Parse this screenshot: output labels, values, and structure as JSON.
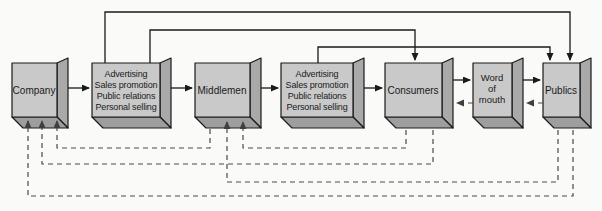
{
  "colors": {
    "background": "#fafaf8",
    "box_front": "#c9c9c9",
    "box_side": "#a9a9a9",
    "box_bottom": "#9e9e9e",
    "box_border": "#1a1a1a",
    "solid_line": "#1a1a1a",
    "dashed_line": "#4a4a4a"
  },
  "nodes": [
    {
      "id": "company",
      "label": "Company"
    },
    {
      "id": "promotion-mix-1",
      "lines": [
        "Advertising",
        "Sales promotion",
        "Public relations",
        "Personal selling"
      ]
    },
    {
      "id": "middlemen",
      "label": "Middlemen"
    },
    {
      "id": "promotion-mix-2",
      "lines": [
        "Advertising",
        "Sales promotion",
        "Public relations",
        "Personal selling"
      ]
    },
    {
      "id": "consumers",
      "label": "Consumers"
    },
    {
      "id": "word-of-mouth",
      "lines": [
        "Word",
        "of",
        "mouth"
      ]
    },
    {
      "id": "publics",
      "label": "Publics"
    }
  ],
  "edges": [
    {
      "from": "company",
      "to": "promotion-mix-1",
      "style": "solid",
      "route": "middle"
    },
    {
      "from": "promotion-mix-1",
      "to": "middlemen",
      "style": "solid",
      "route": "middle"
    },
    {
      "from": "middlemen",
      "to": "promotion-mix-2",
      "style": "solid",
      "route": "middle"
    },
    {
      "from": "promotion-mix-2",
      "to": "consumers",
      "style": "solid",
      "route": "middle"
    },
    {
      "from": "consumers",
      "to": "word-of-mouth",
      "style": "solid",
      "route": "middle"
    },
    {
      "from": "word-of-mouth",
      "to": "publics",
      "style": "solid",
      "route": "middle"
    },
    {
      "from": "promotion-mix-1",
      "to": "publics",
      "style": "solid",
      "route": "top"
    },
    {
      "from": "promotion-mix-1",
      "to": "consumers",
      "style": "solid",
      "route": "top"
    },
    {
      "from": "promotion-mix-2",
      "to": "publics",
      "style": "solid",
      "route": "top"
    },
    {
      "from": "word-of-mouth",
      "to": "consumers",
      "style": "dashed",
      "route": "middle"
    },
    {
      "from": "publics",
      "to": "word-of-mouth",
      "style": "dashed",
      "route": "middle"
    },
    {
      "from": "middlemen",
      "to": "company",
      "style": "dashed",
      "route": "bottom"
    },
    {
      "from": "consumers",
      "to": "middlemen",
      "style": "dashed",
      "route": "bottom"
    },
    {
      "from": "consumers",
      "to": "company",
      "style": "dashed",
      "route": "bottom"
    },
    {
      "from": "publics",
      "to": "middlemen",
      "style": "dashed",
      "route": "bottom"
    },
    {
      "from": "publics",
      "to": "company",
      "style": "dashed",
      "route": "bottom"
    }
  ]
}
